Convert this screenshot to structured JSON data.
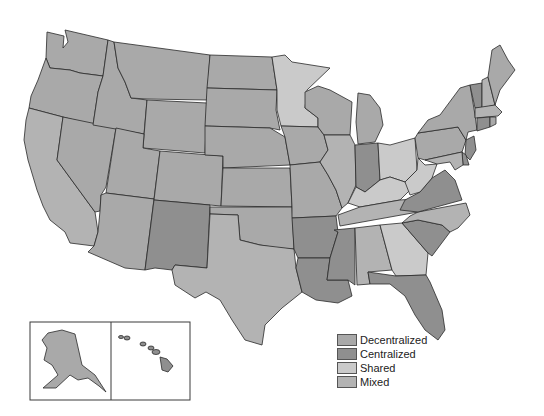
{
  "map": {
    "title": "",
    "categories": {
      "decentralized": {
        "label": "Decentralized",
        "color": "#a9a9a9"
      },
      "centralized": {
        "label": "Centralized",
        "color": "#8f8f8f"
      },
      "shared": {
        "label": "Shared",
        "color": "#cacaca"
      },
      "mixed": {
        "label": "Mixed",
        "color": "#b3b3b3"
      }
    },
    "legend": [
      {
        "key": "decentralized",
        "label": "Decentralized",
        "color": "#a9a9a9"
      },
      {
        "key": "centralized",
        "label": "Centralized",
        "color": "#8f8f8f"
      },
      {
        "key": "shared",
        "label": "Shared",
        "color": "#cacaca"
      },
      {
        "key": "mixed",
        "label": "Mixed",
        "color": "#b3b3b3"
      }
    ],
    "states": {
      "WA": "decentralized",
      "OR": "decentralized",
      "CA": "mixed",
      "NV": "decentralized",
      "ID": "decentralized",
      "MT": "decentralized",
      "WY": "decentralized",
      "UT": "decentralized",
      "AZ": "decentralized",
      "CO": "decentralized",
      "NM": "centralized",
      "ND": "decentralized",
      "SD": "decentralized",
      "NE": "decentralized",
      "KS": "decentralized",
      "OK": "decentralized",
      "TX": "mixed",
      "MN": "shared",
      "IA": "decentralized",
      "MO": "decentralized",
      "AR": "centralized",
      "LA": "centralized",
      "WI": "decentralized",
      "IL": "mixed",
      "MS": "centralized",
      "MI": "decentralized",
      "IN": "centralized",
      "KY": "shared",
      "TN": "mixed",
      "AL": "mixed",
      "OH": "shared",
      "WV": "shared",
      "VA": "centralized",
      "NC": "mixed",
      "SC": "centralized",
      "GA": "shared",
      "FL": "centralized",
      "PA": "decentralized",
      "NY": "decentralized",
      "VT": "centralized",
      "NH": "mixed",
      "ME": "decentralized",
      "MA": "mixed",
      "CT": "centralized",
      "RI": "decentralized",
      "NJ": "centralized",
      "DE": "centralized",
      "MD": "mixed",
      "AK": "decentralized",
      "HI": "centralized"
    }
  }
}
